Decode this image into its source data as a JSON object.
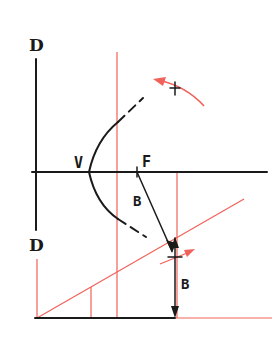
{
  "diagram": {
    "labels": {
      "directrix_top": "D",
      "directrix_bottom": "D",
      "vertex": "V",
      "focus": "F",
      "distance_focus": "B",
      "distance_offset": "B",
      "plus_mark": "+"
    },
    "colors": {
      "ink": "#1a1a1a",
      "construction": "#f0625a",
      "background": "#ffffff"
    }
  }
}
